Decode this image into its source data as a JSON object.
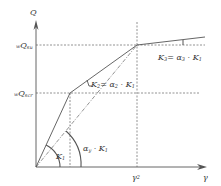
{
  "diagram": {
    "type": "trilinear skeleton curve",
    "colors": {
      "line": "#555555",
      "dashed": "#777777",
      "text": "#333333",
      "background": "#ffffff"
    },
    "axes": {
      "y_label": "Q",
      "x_label": "γ"
    },
    "levels": {
      "upper_prefix": "w",
      "upper_main": "Q",
      "upper_sub": "su",
      "lower_prefix": "w",
      "lower_main": "Q",
      "lower_sub": "scr"
    },
    "x_marks": {
      "gamma2_main": "γ",
      "gamma2_sub": "2"
    },
    "stiffness_labels": {
      "k1_main": "K",
      "k1_sub": "1",
      "k2_main": "K",
      "k2_sub": "2",
      "k2_eq": "= α",
      "k2_alpha_sub": "2",
      "k2_rhs": " · K",
      "k2_rhs_sub": "1",
      "k3_main": "K",
      "k3_sub": "3",
      "k3_eq": "= α",
      "k3_alpha_sub": "3",
      "k3_rhs": " · K",
      "k3_rhs_sub": "1",
      "ay_main": "α",
      "ay_sub": "y",
      "ay_rhs": " · K",
      "ay_rhs_sub": "1"
    }
  }
}
